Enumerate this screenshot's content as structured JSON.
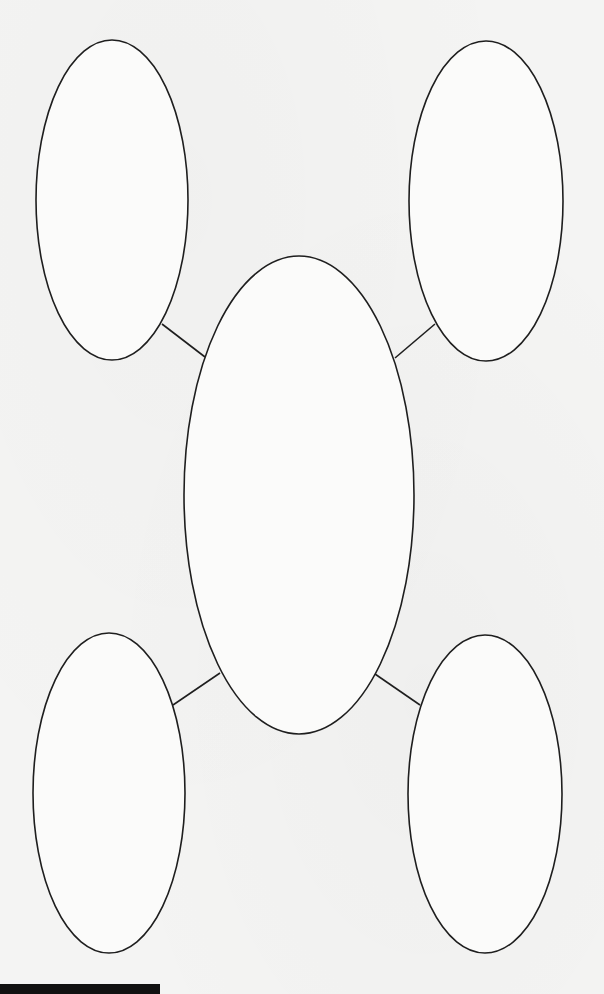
{
  "diagram": {
    "type": "bubble-map",
    "background_color": "#f4f4f3",
    "stroke_color": "#1e1e1e",
    "nodes": [
      {
        "id": "top-left",
        "label": "",
        "cx": 112,
        "cy": 200,
        "rx": 76,
        "ry": 160
      },
      {
        "id": "top-right",
        "label": "",
        "cx": 486,
        "cy": 201,
        "rx": 77,
        "ry": 160
      },
      {
        "id": "center",
        "label": "",
        "cx": 299,
        "cy": 495,
        "rx": 115,
        "ry": 239
      },
      {
        "id": "bottom-left",
        "label": "",
        "cx": 109,
        "cy": 793,
        "rx": 76,
        "ry": 160
      },
      {
        "id": "bottom-right",
        "label": "",
        "cx": 485,
        "cy": 794,
        "rx": 77,
        "ry": 159
      }
    ],
    "edges": [
      {
        "from": "center",
        "to": "top-left",
        "x1": 205,
        "y1": 357,
        "x2": 162,
        "y2": 324
      },
      {
        "from": "center",
        "to": "top-right",
        "x1": 395,
        "y1": 358,
        "x2": 435,
        "y2": 324
      },
      {
        "from": "center",
        "to": "bottom-left",
        "x1": 220,
        "y1": 673,
        "x2": 173,
        "y2": 705
      },
      {
        "from": "center",
        "to": "bottom-right",
        "x1": 375,
        "y1": 674,
        "x2": 420,
        "y2": 705
      }
    ]
  },
  "footer": {
    "bar_color": "#111111",
    "text": ""
  }
}
